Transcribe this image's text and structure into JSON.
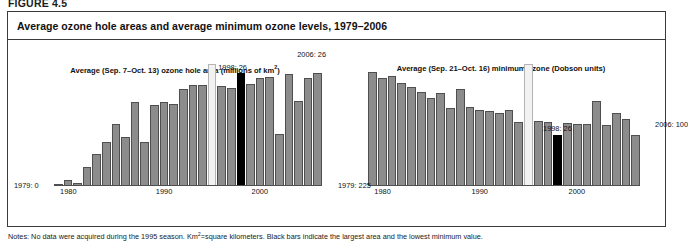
{
  "figure": {
    "number_label": "FIGURE 4.5",
    "panel_title": "Average ozone hole areas and average minimum ozone levels, 1979–2006",
    "notes_prefix": "Notes: No data were acquired during the 1995 season. Km",
    "notes_sup": "2",
    "notes_suffix": "=square kilometers. Black bars indicate the largest area and the lowest minimum value."
  },
  "chart_data": [
    {
      "id": "ozone-hole-area",
      "type": "bar",
      "title_prefix": "Average (Sep. 7–Oct. 13) ozone hole area (millions of km",
      "title_sup": "2",
      "title_suffix": ")",
      "title": "Average (Sep. 7–Oct. 13) ozone hole area (millions of km²)",
      "xlabel": "",
      "ylabel": "millions of km²",
      "ylim": [
        0,
        28
      ],
      "grid": false,
      "legend": "none",
      "categories": [
        1979,
        1980,
        1981,
        1982,
        1983,
        1984,
        1985,
        1986,
        1987,
        1988,
        1989,
        1990,
        1991,
        1992,
        1993,
        1994,
        1995,
        1996,
        1997,
        1998,
        1999,
        2000,
        2001,
        2002,
        2003,
        2004,
        2005,
        2006
      ],
      "values": [
        0.1,
        1.4,
        0.6,
        4.3,
        7.3,
        10.1,
        14.2,
        11.3,
        19.3,
        10.2,
        18.7,
        19.2,
        18.8,
        22.3,
        23.2,
        23.1,
        0,
        23.0,
        22.6,
        26.0,
        23.4,
        24.8,
        25.0,
        12.0,
        25.8,
        19.5,
        24.8,
        26.0
      ],
      "nodata_index": 16,
      "highlight_index": 19,
      "highlight_meaning": "largest area",
      "xticks": [
        {
          "label": "1980",
          "index": 1
        },
        {
          "label": "1990",
          "index": 11
        },
        {
          "label": "2000",
          "index": 21
        }
      ],
      "annotations": [
        {
          "text": "1998: 26",
          "index": 19,
          "position": "above-left"
        }
      ],
      "endpoints": {
        "start": "1979: 0",
        "end": "2006: 26"
      }
    },
    {
      "id": "minimum-ozone",
      "type": "bar",
      "title": "Average (Sep. 21–Oct. 16) minimum ozone (Dobson units)",
      "xlabel": "",
      "ylabel": "Dobson units",
      "ylim": [
        0,
        240
      ],
      "grid": false,
      "legend": "none",
      "categories": [
        1979,
        1980,
        1981,
        1982,
        1983,
        1984,
        1985,
        1986,
        1987,
        1988,
        1989,
        1990,
        1991,
        1992,
        1993,
        1994,
        1995,
        1996,
        1997,
        1998,
        1999,
        2000,
        2001,
        2002,
        2003,
        2004,
        2005,
        2006
      ],
      "values": [
        225,
        212,
        216,
        202,
        194,
        185,
        173,
        182,
        153,
        190,
        155,
        150,
        147,
        143,
        150,
        125,
        0,
        128,
        126,
        100,
        124,
        122,
        122,
        167,
        121,
        144,
        131,
        100
      ],
      "nodata_index": 16,
      "highlight_index": 19,
      "highlight_meaning": "lowest minimum value",
      "xticks": [
        {
          "label": "1980",
          "index": 1
        },
        {
          "label": "1990",
          "index": 11
        },
        {
          "label": "2000",
          "index": 21
        }
      ],
      "annotations": [
        {
          "text": "1998: 26",
          "index": 19,
          "position": "above"
        }
      ],
      "endpoints": {
        "start": "1979: 225",
        "end": "2006: 100"
      }
    }
  ],
  "colors": {
    "bar": "#8c8c8c",
    "bar_border": "#4f4f4f",
    "highlight": "#000000",
    "nodata": "#f2f2f2",
    "panel_border": "#3a3a3a",
    "text": "#111111"
  }
}
